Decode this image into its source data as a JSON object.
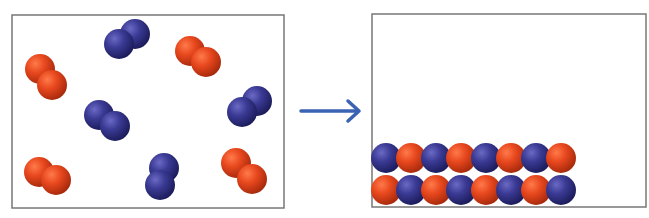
{
  "diagram": {
    "colors": {
      "red_atom": "#e8481e",
      "red_dark": "#a82a0c",
      "blue_atom": "#3a3a94",
      "blue_dark": "#1c1c5c",
      "arrow": "#3a63b4",
      "box_border": "#777777"
    },
    "left_box": {
      "x": 12,
      "y": 15,
      "w": 272,
      "h": 193,
      "molecules": [
        {
          "type": "red",
          "atoms": [
            [
              40,
              69
            ],
            [
              52,
              85
            ]
          ]
        },
        {
          "type": "blue",
          "atoms": [
            [
              135,
              34
            ],
            [
              119,
              44
            ]
          ]
        },
        {
          "type": "red",
          "atoms": [
            [
              190,
              51
            ],
            [
              206,
              62
            ]
          ]
        },
        {
          "type": "blue",
          "atoms": [
            [
              99,
              115
            ],
            [
              115,
              126
            ]
          ]
        },
        {
          "type": "blue",
          "atoms": [
            [
              257,
              101
            ],
            [
              242,
              112
            ]
          ]
        },
        {
          "type": "red",
          "atoms": [
            [
              39,
              172
            ],
            [
              56,
              180
            ]
          ]
        },
        {
          "type": "blue",
          "atoms": [
            [
              164,
              168
            ],
            [
              160,
              185
            ]
          ]
        },
        {
          "type": "red",
          "atoms": [
            [
              236,
              163
            ],
            [
              252,
              179
            ]
          ]
        }
      ]
    },
    "arrow": {
      "x1": 301,
      "x2": 359,
      "y": 111
    },
    "right_box": {
      "x": 372,
      "y": 14,
      "w": 274,
      "h": 193,
      "rows": [
        {
          "y": 158,
          "pairs": [
            [
              "blue",
              "red"
            ],
            [
              "blue",
              "red"
            ],
            [
              "blue",
              "red"
            ],
            [
              "blue",
              "red"
            ]
          ]
        },
        {
          "y": 190,
          "pairs": [
            [
              "red",
              "blue"
            ],
            [
              "red",
              "blue"
            ],
            [
              "red",
              "blue"
            ],
            [
              "red",
              "blue"
            ]
          ]
        }
      ],
      "pair_x": [
        386,
        436,
        486,
        536
      ],
      "atom_spacing": 25
    },
    "atom_radius": 15
  }
}
